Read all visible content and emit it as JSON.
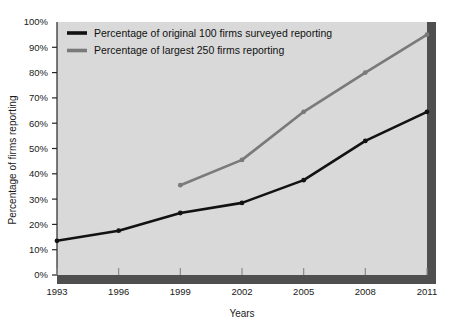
{
  "chart_data": {
    "type": "line",
    "title": "",
    "xlabel": "Years",
    "ylabel": "Percentage of firms reporting",
    "x": [
      1993,
      1996,
      1999,
      2002,
      2005,
      2008,
      2011
    ],
    "xtick_labels": [
      "1993",
      "1996",
      "1999",
      "2002",
      "2005",
      "2008",
      "2011"
    ],
    "ytick_labels": [
      "0%",
      "10%",
      "20%",
      "30%",
      "40%",
      "50%",
      "60%",
      "70%",
      "80%",
      "90%",
      "100%"
    ],
    "ytick_values": [
      0,
      10,
      20,
      30,
      40,
      50,
      60,
      70,
      80,
      90,
      100
    ],
    "ylim": [
      0,
      100
    ],
    "xlim": [
      1993,
      2011
    ],
    "grid": false,
    "legend_position": "top-left-inside",
    "series": [
      {
        "name": "Percentage of original 100 firms surveyed reporting",
        "color": "#121212",
        "x": [
          1993,
          1996,
          1999,
          2002,
          2005,
          2008,
          2011
        ],
        "values": [
          13.5,
          17.5,
          24.5,
          28.5,
          37.5,
          53.0,
          64.5
        ]
      },
      {
        "name": "Percentage of largest 250 firms reporting",
        "color": "#7a7a7a",
        "x": [
          1999,
          2002,
          2005,
          2008,
          2011
        ],
        "values": [
          35.5,
          45.5,
          64.5,
          80.0,
          95.0
        ]
      }
    ]
  },
  "figure": {
    "plot_background": "#d9d9d9",
    "page_background": "#ffffff",
    "shadow_color": "#4f4f4f",
    "axis_color": "#262626"
  },
  "legend": {
    "entries": [
      {
        "label": "Percentage of original 100 firms surveyed reporting",
        "color": "#121212"
      },
      {
        "label": "Percentage of largest 250 firms reporting",
        "color": "#7a7a7a"
      }
    ]
  }
}
